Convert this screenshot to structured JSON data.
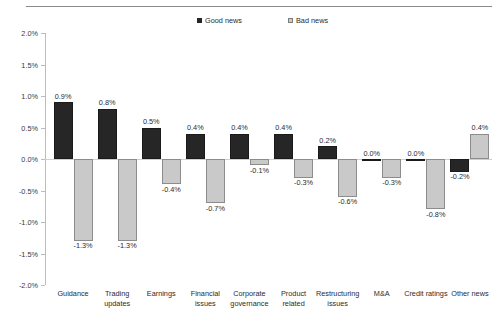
{
  "chart_data": {
    "type": "bar",
    "title": "",
    "subtitle": "",
    "xlabel": "",
    "ylabel": "",
    "ylim": [
      -2.0,
      2.0
    ],
    "grid": false,
    "legend_position": "top-center",
    "y_format": "percent",
    "yticks": [
      "2.0%",
      "1.5%",
      "1.0%",
      "0.5%",
      "0.0%",
      "-0.5%",
      "-1.0%",
      "-1.5%",
      "-2.0%"
    ],
    "ytick_values": [
      2.0,
      1.5,
      1.0,
      0.5,
      0.0,
      -0.5,
      -1.0,
      -1.5,
      -2.0
    ],
    "categories": [
      "Guidance",
      "Trading updates",
      "Earnings",
      "Financial issues",
      "Corporate governance",
      "Product related",
      "Restructuring issues",
      "M&A",
      "Credit ratings",
      "Other news"
    ],
    "category_lines": [
      [
        "Guidance"
      ],
      [
        "Trading",
        "updates"
      ],
      [
        "Earnings"
      ],
      [
        "Financial",
        "issues"
      ],
      [
        "Corporate",
        "governance"
      ],
      [
        "Product",
        "related"
      ],
      [
        "Restructuring",
        "issues"
      ],
      [
        "M&A"
      ],
      [
        "Credit ratings"
      ],
      [
        "Other news"
      ]
    ],
    "series": [
      {
        "name": "Good news",
        "color": "#262626",
        "values": [
          0.9,
          0.8,
          0.5,
          0.4,
          0.4,
          0.4,
          0.2,
          0.0,
          0.0,
          -0.2
        ],
        "labels": [
          "0.9%",
          "0.8%",
          "0.5%",
          "0.4%",
          "0.4%",
          "0.4%",
          "0.2%",
          "0.0%",
          "0.0%",
          "-0.2%"
        ]
      },
      {
        "name": "Bad news",
        "color": "#c9c9c9",
        "values": [
          -1.3,
          -1.3,
          -0.4,
          -0.7,
          -0.1,
          -0.3,
          -0.6,
          -0.3,
          -0.8,
          0.4
        ],
        "labels": [
          "-1.3%",
          "-1.3%",
          "-0.4%",
          "-0.7%",
          "-0.1%",
          "-0.3%",
          "-0.6%",
          "-0.3%",
          "-0.8%",
          "0.4%"
        ]
      }
    ]
  },
  "legend": {
    "items": [
      {
        "label": "Good news",
        "swatch": "good"
      },
      {
        "label": "Bad news",
        "swatch": "bad"
      }
    ]
  },
  "colors": {
    "good_news": "#262626",
    "bad_news": "#c9c9c9",
    "axis": "#bdbdbd",
    "text": "#2b2b2b",
    "rule": "#8a8a8a"
  }
}
